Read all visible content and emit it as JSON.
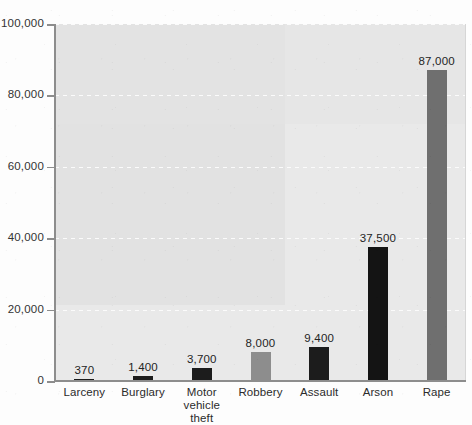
{
  "chart_data": {
    "type": "bar",
    "title": "",
    "subtitle": "",
    "xlabel": "",
    "ylabel": "",
    "ylim": [
      0,
      100000
    ],
    "grid": true,
    "legend": "none",
    "categories": [
      "Larceny",
      "Burglary",
      "Motor vehicle theft",
      "Robbery",
      "Assault",
      "Arson",
      "Rape"
    ],
    "values": [
      370,
      1400,
      3700,
      8000,
      9400,
      37500,
      87000
    ],
    "value_labels": [
      "370",
      "1,400",
      "3,700",
      "8,000",
      "9,400",
      "37,500",
      "87,000"
    ],
    "bar_colors": [
      "#1c1c1c",
      "#1c1c1c",
      "#1c1c1c",
      "#8d8d8d",
      "#1c1c1c",
      "#141414",
      "#6f6f6f"
    ],
    "ytick_labels": [
      "0",
      "20,000",
      "40,000",
      "60,000",
      "80,000",
      "100,000"
    ],
    "ytick_values": [
      0,
      20000,
      40000,
      60000,
      80000,
      100000
    ],
    "plot_background": "#e9e9e9",
    "gridline_color": "#fbfbfb",
    "axis_color": "#8d8d8d"
  }
}
